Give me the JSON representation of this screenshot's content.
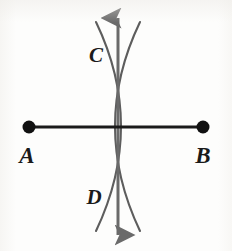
{
  "figure": {
    "background_color": "#fdfdfc",
    "ink_color": "#4a4a4a",
    "segment_color": "#1a1a1a",
    "label_color": "#1a1a1a"
  },
  "labels": {
    "a": "A",
    "b": "B",
    "c": "C",
    "d": "D"
  },
  "points": {
    "a": {
      "name": "A",
      "x": 29,
      "y": 127
    },
    "b": {
      "name": "B",
      "x": 203,
      "y": 127
    },
    "c": {
      "name": "C",
      "x": 118,
      "y": 55
    },
    "d": {
      "name": "D",
      "x": 118,
      "y": 196
    }
  },
  "label_positions": {
    "a": {
      "x": 27,
      "y": 162
    },
    "b": {
      "x": 196,
      "y": 162
    },
    "c": {
      "x": 88,
      "y": 62
    },
    "d": {
      "x": 86,
      "y": 204
    }
  },
  "segment_ab": {
    "name": "segment-ab",
    "x1": 29,
    "y1": 127,
    "x2": 203,
    "y2": 127,
    "stroke_width": 3.2,
    "endpoint_radius": 6.5
  },
  "bisector_line": {
    "name": "perpendicular-bisector",
    "x": 118,
    "y_top": 12,
    "y_bottom": 241,
    "stroke_width": 3.0,
    "arrowheads": "both"
  },
  "arc_from_a": {
    "name": "arc-centered-at-a",
    "center_x": 29,
    "center_y": 127,
    "radius": 122,
    "stroke_width": 2.1,
    "description": "compass arc swung from A, passing through C and D"
  },
  "arc_from_b": {
    "name": "arc-centered-at-b",
    "center_x": 203,
    "center_y": 127,
    "radius": 122,
    "stroke_width": 2.1,
    "description": "compass arc swung from B, passing through C and D"
  },
  "geometry_notes": {
    "arc_left_extreme_x": 87,
    "arc_right_extreme_x": 150,
    "intersection_top": "C",
    "intersection_bottom": "D"
  }
}
